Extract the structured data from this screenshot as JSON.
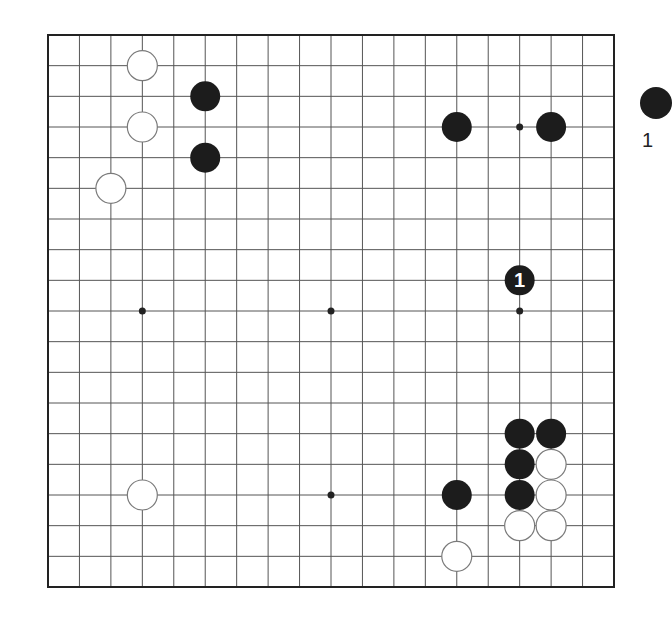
{
  "board": {
    "size": 19,
    "left": 48,
    "top": 35,
    "right": 614,
    "bottom": 587,
    "line_color": "#555555",
    "border_color": "#222222",
    "black_color": "#1c1c1c",
    "white_fill": "#ffffff",
    "white_stroke": "#7a7a7a",
    "star_points": [
      {
        "col": 15,
        "row": 3
      },
      {
        "col": 3,
        "row": 9
      },
      {
        "col": 9,
        "row": 9
      },
      {
        "col": 15,
        "row": 9
      },
      {
        "col": 3,
        "row": 15
      },
      {
        "col": 9,
        "row": 15
      },
      {
        "col": 15,
        "row": 15
      }
    ],
    "stones": [
      {
        "color": "white",
        "col": 3,
        "row": 1
      },
      {
        "color": "black",
        "col": 5,
        "row": 2
      },
      {
        "color": "white",
        "col": 3,
        "row": 3
      },
      {
        "color": "black",
        "col": 5,
        "row": 4
      },
      {
        "color": "white",
        "col": 2,
        "row": 5
      },
      {
        "color": "black",
        "col": 13,
        "row": 3
      },
      {
        "color": "black",
        "col": 16,
        "row": 3
      },
      {
        "color": "black",
        "col": 15,
        "row": 8,
        "label": "1"
      },
      {
        "color": "black",
        "col": 15,
        "row": 13
      },
      {
        "color": "black",
        "col": 16,
        "row": 13
      },
      {
        "color": "black",
        "col": 15,
        "row": 14
      },
      {
        "color": "white",
        "col": 16,
        "row": 14
      },
      {
        "color": "black",
        "col": 15,
        "row": 15
      },
      {
        "color": "white",
        "col": 16,
        "row": 15
      },
      {
        "color": "white",
        "col": 15,
        "row": 16
      },
      {
        "color": "white",
        "col": 16,
        "row": 16
      },
      {
        "color": "white",
        "col": 3,
        "row": 15
      },
      {
        "color": "black",
        "col": 13,
        "row": 15
      },
      {
        "color": "white",
        "col": 13,
        "row": 17
      }
    ]
  },
  "caption": {
    "stone_color": "black",
    "text": "1"
  }
}
